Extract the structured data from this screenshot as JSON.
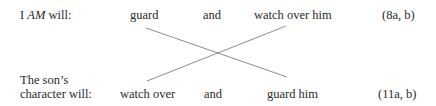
{
  "row1": {
    "label_pre": "I ",
    "label_em": "AM",
    "label_post": " will:",
    "term1": "guard",
    "conj": "and",
    "term2": "watch over him",
    "ref": "(8a, b)"
  },
  "row2": {
    "label_line1": "The son’s",
    "label_line2": "character will:",
    "term1": "watch over",
    "conj": "and",
    "term2": "guard him",
    "ref": "(11a, b)"
  },
  "colors": {
    "text": "#2a2a2a",
    "line": "#6e6e6e"
  }
}
